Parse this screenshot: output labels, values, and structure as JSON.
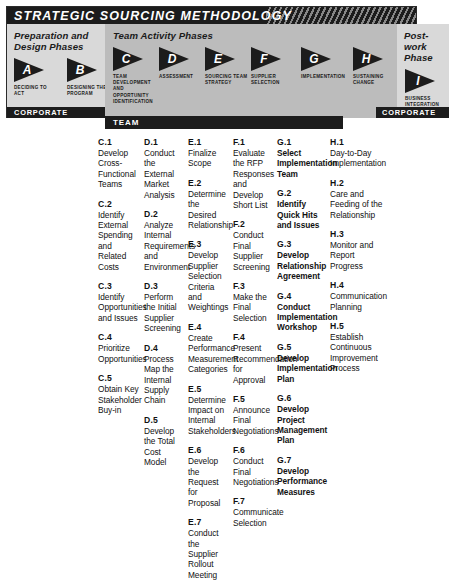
{
  "diagram": {
    "title": "STRATEGIC SOURCING METHODOLOGY",
    "bands": [
      {
        "heading": "Preparation and Design Phases",
        "footer": "CORPORATE"
      },
      {
        "heading": "Team Activity Phases",
        "footer": "TEAM"
      },
      {
        "heading": "Post-work Phase",
        "footer": "CORPORATE"
      }
    ],
    "phases": [
      {
        "letter": "A",
        "label": "DECIDING TO ACT"
      },
      {
        "letter": "B",
        "label": "DESIGNING THE PROGRAM"
      },
      {
        "letter": "C",
        "label": "TEAM DEVELOPMENT AND OPPORTUNITY IDENTIFICATION"
      },
      {
        "letter": "D",
        "label": "ASSESSMENT"
      },
      {
        "letter": "E",
        "label": "SOURCING TEAM STRATEGY"
      },
      {
        "letter": "F",
        "label": "SUPPLIER SELECTION"
      },
      {
        "letter": "G",
        "label": "IMPLEMENTATION"
      },
      {
        "letter": "H",
        "label": "SUSTAINING CHANGE"
      },
      {
        "letter": "I",
        "label": "BUSINESS INTEGRATION"
      }
    ]
  },
  "columns": {
    "C": [
      {
        "id": "C.1",
        "text": "Develop Cross-Functional Teams"
      },
      {
        "id": "C.2",
        "text": "Identify External Spending and Related Costs"
      },
      {
        "id": "C.3",
        "text": "Identify Opportunities and Issues"
      },
      {
        "id": "C.4",
        "text": "Prioritize Opportunities"
      },
      {
        "id": "C.5",
        "text": "Obtain Key Stakeholder Buy-in"
      }
    ],
    "D": [
      {
        "id": "D.1",
        "text": "Conduct the External Market Analysis"
      },
      {
        "id": "D.2",
        "text": "Analyze Internal Requirements and Environment"
      },
      {
        "id": "D.3",
        "text": "Perform the Initial Supplier Screening"
      },
      {
        "id": "D.4",
        "text": "Process Map the Internal Supply Chain"
      },
      {
        "id": "D.5",
        "text": "Develop the Total Cost Model"
      }
    ],
    "E": [
      {
        "id": "E.1",
        "text": "Finalize Scope"
      },
      {
        "id": "E.2",
        "text": "Determine the Desired Relationship"
      },
      {
        "id": "E.3",
        "text": "Develop Supplier Selection Criteria and Weightings"
      },
      {
        "id": "E.4",
        "text": "Create Performance Measurement Categories"
      },
      {
        "id": "E.5",
        "text": "Determine Impact on Internal Stakeholders"
      },
      {
        "id": "E.6",
        "text": "Develop the Request for Proposal"
      },
      {
        "id": "E.7",
        "text": "Conduct the Supplier Rollout Meeting"
      }
    ],
    "F": [
      {
        "id": "F.1",
        "text": "Evaluate the RFP Responses and Develop Short List"
      },
      {
        "id": "F.2",
        "text": "Conduct Final Supplier Screening"
      },
      {
        "id": "F.3",
        "text": "Make the Final Selection"
      },
      {
        "id": "F.4",
        "text": "Present Recommendation for Approval"
      },
      {
        "id": "F.5",
        "text": "Announce Final Negotiations"
      },
      {
        "id": "F.6",
        "text": "Conduct Final Negotiations"
      },
      {
        "id": "F.7",
        "text": "Communicate Selection"
      }
    ],
    "G": [
      {
        "id": "G.1",
        "text": "Select Implementation Team"
      },
      {
        "id": "G.2",
        "text": "Identify Quick Hits and Issues"
      },
      {
        "id": "G.3",
        "text": "Develop Relationship Agreement"
      },
      {
        "id": "G.4",
        "text": "Conduct Implementation Workshop"
      },
      {
        "id": "G.5",
        "text": "Develop Implementation Plan"
      },
      {
        "id": "G.6",
        "text": "Develop Project Management Plan"
      },
      {
        "id": "G.7",
        "text": "Develop Performance Measures"
      }
    ],
    "H": [
      {
        "id": "H.1",
        "text": "Day-to-Day Implementation"
      },
      {
        "id": "H.2",
        "text": "Care and Feeding of the Relationship"
      },
      {
        "id": "H.3",
        "text": "Monitor and Report Progress"
      },
      {
        "id": "H.4",
        "text": "Communication Planning"
      },
      {
        "id": "H.5",
        "text": "Establish Continuous Improvement Process"
      }
    ]
  }
}
